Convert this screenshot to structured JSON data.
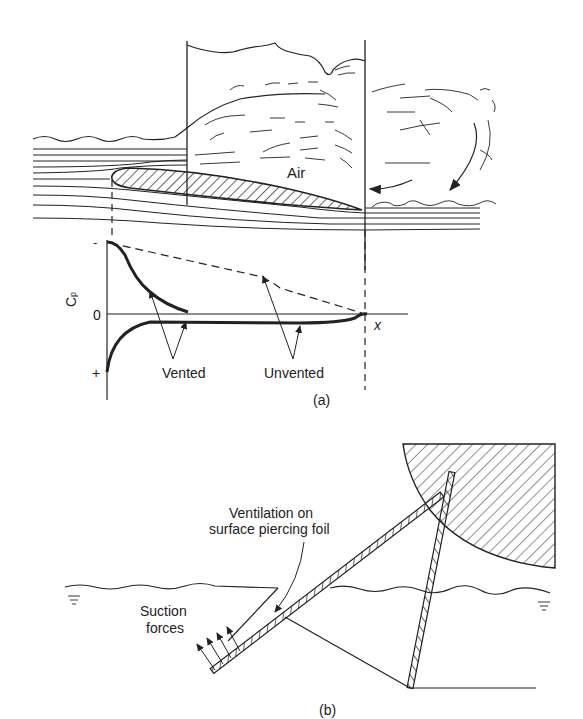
{
  "panel_a": {
    "caption": "(a)",
    "air_label": "Air",
    "axis": {
      "y_label": "C",
      "y_subscript": "p",
      "x_label": "x",
      "tick_minus": "-",
      "tick_zero": "0",
      "tick_plus": "+"
    },
    "curve_labels": {
      "vented": "Vented",
      "unvented": "Unvented"
    }
  },
  "panel_b": {
    "caption": "(b)",
    "ventilation_label_line1": "Ventilation on",
    "ventilation_label_line2": "surface piercing foil",
    "suction_label_line1": "Suction",
    "suction_label_line2": "forces"
  },
  "colors": {
    "ink": "#222222",
    "background": "#ffffff"
  }
}
